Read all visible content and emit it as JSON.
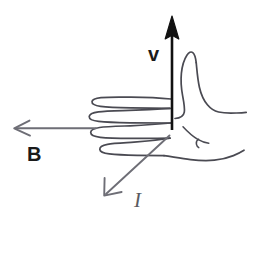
{
  "diagram": {
    "type": "hand-drawn physics vector diagram",
    "background_color": "#ffffff",
    "width": 268,
    "height": 278,
    "hand": {
      "name": "right-hand-outline",
      "description": "Outline sketch of a right hand in profile with four curled fingers pointing left, thumb extended upward, palm and wrist extending to the right",
      "stroke_color": "#4a4a52",
      "fill": "none"
    },
    "vectors": [
      {
        "id": "v",
        "label": "v",
        "label_style": "bold lowercase",
        "meaning": "velocity",
        "direction": "up",
        "color": "#111111",
        "arrowhead": "solid-filled-triangle",
        "from": [
          172,
          130
        ],
        "to": [
          172,
          18
        ]
      },
      {
        "id": "B",
        "label": "B",
        "label_style": "bold uppercase",
        "meaning": "magnetic field",
        "direction": "left",
        "color": "#6e6e76",
        "arrowhead": "open-v",
        "from": [
          96,
          128
        ],
        "to": [
          14,
          128
        ]
      },
      {
        "id": "I",
        "label": "I",
        "label_style": "italic",
        "meaning": "current",
        "direction": "down-left",
        "color": "#6e6e76",
        "arrowhead": "open-v",
        "from": [
          169,
          136
        ],
        "to": [
          104,
          196
        ]
      }
    ],
    "labels": {
      "velocity": "v",
      "magnetic_field": "B",
      "current": "I"
    }
  }
}
